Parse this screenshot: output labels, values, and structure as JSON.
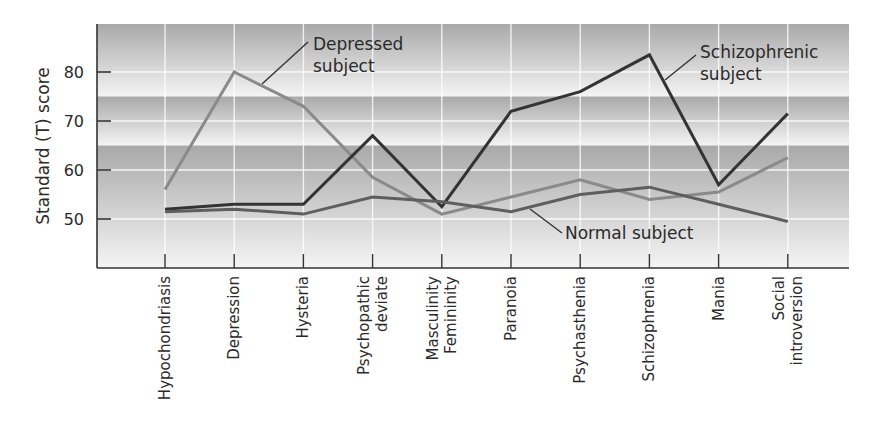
{
  "chart_data": {
    "type": "line",
    "title": "",
    "xlabel": "",
    "ylabel": "Standard (T) score",
    "ylim": [
      40,
      90
    ],
    "yticks": [
      50,
      60,
      70,
      80
    ],
    "ytick_labels": [
      "50",
      "60",
      "70",
      "80"
    ],
    "grid": true,
    "background_bands": [
      {
        "from": 75,
        "to": 90,
        "shade": "dark-to-light"
      },
      {
        "from": 65,
        "to": 75,
        "shade": "dark-to-light"
      },
      {
        "from": 40,
        "to": 65,
        "shade": "dark-to-light"
      }
    ],
    "categories": [
      [
        "Hypochondriasis"
      ],
      [
        "Depression"
      ],
      [
        "Hysteria"
      ],
      [
        "Psychopathic",
        "deviate"
      ],
      [
        "Masculinity",
        "Femininity"
      ],
      [
        "Paranoia"
      ],
      [
        "Psychasthenia"
      ],
      [
        "Schizophrenia"
      ],
      [
        "Mania"
      ],
      [
        "Social",
        "introversion"
      ]
    ],
    "series": [
      {
        "name": "Depressed subject",
        "label_lines": [
          "Depressed",
          "subject"
        ],
        "color": "#8a8a8a",
        "values": [
          56,
          80,
          73,
          58.5,
          51,
          54.5,
          58,
          54,
          55.5,
          62.5
        ]
      },
      {
        "name": "Schizophrenic subject",
        "label_lines": [
          "Schizophrenic",
          "subject"
        ],
        "color": "#333333",
        "values": [
          52,
          53,
          53,
          67,
          52.5,
          72,
          76,
          83.5,
          57,
          71.5
        ]
      },
      {
        "name": "Normal subject",
        "label_lines": [
          "Normal subject"
        ],
        "color": "#5e5e5e",
        "values": [
          51.5,
          52,
          51,
          54.5,
          53.5,
          51.5,
          55,
          56.5,
          53,
          49.5
        ]
      }
    ]
  }
}
